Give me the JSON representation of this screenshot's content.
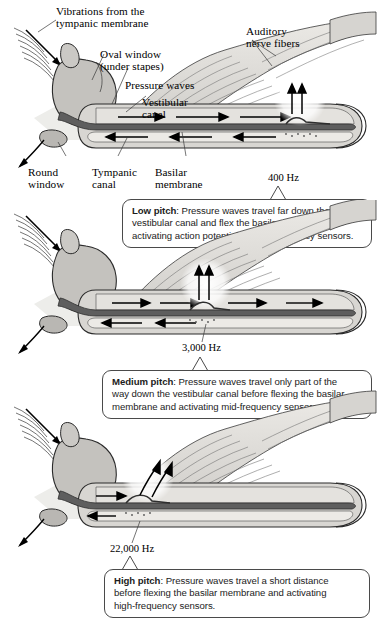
{
  "figure": {
    "type": "anatomical-diagram",
    "panel_count": 3
  },
  "labels": {
    "vibrations": "Vibrations from the\ntympanic membrane",
    "oval_window": "Oval window\n(under stapes)",
    "pressure_waves": "Pressure waves",
    "vestibular_canal": "Vestibular\ncanal",
    "auditory_nerve": "Auditory\nnerve fibers",
    "round_window": "Round\nwindow",
    "tympanic_canal": "Tympanic\ncanal",
    "basilar_membrane": "Basilar\nmembrane"
  },
  "panels": [
    {
      "id": "low",
      "frequency": "400 Hz",
      "caption_bold": "Low pitch",
      "caption_rest": ": Pressure waves travel far down the vestibular canal and flex the basilar membrane, activating action potentials in low-frequency sensors.",
      "caption_lines": [
        "Low pitch: Pressure waves travel far down the",
        "vestibular canal and flex the basilar membrane,",
        "activating action potentials in low-frequency sensors."
      ],
      "flex_position_pct": 78
    },
    {
      "id": "medium",
      "frequency": "3,000 Hz",
      "caption_bold": "Medium pitch",
      "caption_rest": ": Pressure waves travel only part of the way down the vestibular canal before flexing the basilar membrane and activating mid-frequency sensors.",
      "caption_lines": [
        "Medium pitch: Pressure waves travel only part of the",
        "way down the vestibular canal before flexing the basilar",
        "membrane and activating mid-frequency sensors."
      ],
      "flex_position_pct": 48
    },
    {
      "id": "high",
      "frequency": "22,000 Hz",
      "caption_bold": "High pitch",
      "caption_rest": ": Pressure waves travel a short distance before flexing the basilar membrane and activating high-frequency sensors.",
      "caption_lines": [
        "High pitch: Pressure waves travel a short distance",
        "before flexing the basilar membrane and activating",
        "high-frequency sensors."
      ],
      "flex_position_pct": 22
    }
  ],
  "colors": {
    "background": "#ffffff",
    "outline": "#2a2a2a",
    "membrane_dark": "#585858",
    "canal_fill": "#d8d6d2",
    "cochlea_fill": "#c9c7c3",
    "nerve_fill": "#dedcd8",
    "shadow": "#e8e6e2",
    "caption_border": "#4a4a4a",
    "text": "#000000"
  },
  "icons": {
    "sound_wave": "sound-wave-icon",
    "arrow_right": "arrow-right-icon",
    "arrow_left": "arrow-left-icon",
    "arrow_up": "arrow-up-icon",
    "leader_line": "leader-line-icon"
  }
}
